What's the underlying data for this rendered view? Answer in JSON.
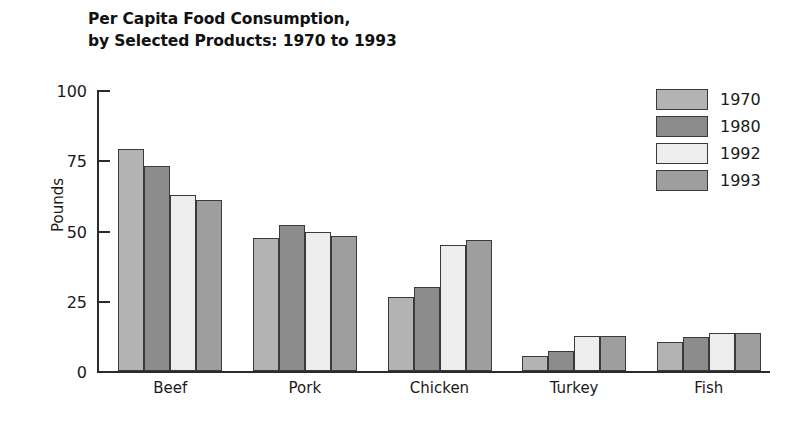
{
  "chart_data": {
    "type": "bar",
    "title": "Per Capita Food Consumption,\nby Selected Products: 1970 to 1993",
    "title_line1": "Per Capita Food Consumption,",
    "title_line2": "by Selected Products: 1970 to 1993",
    "xlabel": "",
    "ylabel": "Pounds",
    "ylim": [
      0,
      100
    ],
    "yticks": [
      0,
      25,
      50,
      75,
      100
    ],
    "ytick_labels": [
      "0",
      "25",
      "50",
      "75",
      "100"
    ],
    "grid": false,
    "legend_position": "top-right",
    "categories": [
      "Beef",
      "Pork",
      "Chicken",
      "Turkey",
      "Fish"
    ],
    "series": [
      {
        "name": "1970",
        "color": "#b3b3b3",
        "values": [
          79,
          47.5,
          26.5,
          5.5,
          10.5
        ]
      },
      {
        "name": "1980",
        "color": "#8c8c8c",
        "values": [
          73,
          52,
          30,
          7,
          12
        ]
      },
      {
        "name": "1992",
        "color": "#ededed",
        "values": [
          62.5,
          49.5,
          45,
          12.5,
          13.5
        ]
      },
      {
        "name": "1993",
        "color": "#9e9e9e",
        "values": [
          61,
          48,
          46.5,
          12.5,
          13.5
        ]
      }
    ]
  },
  "legend": {
    "items": [
      {
        "label": "1970",
        "color": "#b3b3b3"
      },
      {
        "label": "1980",
        "color": "#8c8c8c"
      },
      {
        "label": "1992",
        "color": "#ededed"
      },
      {
        "label": "1993",
        "color": "#9e9e9e"
      }
    ]
  }
}
